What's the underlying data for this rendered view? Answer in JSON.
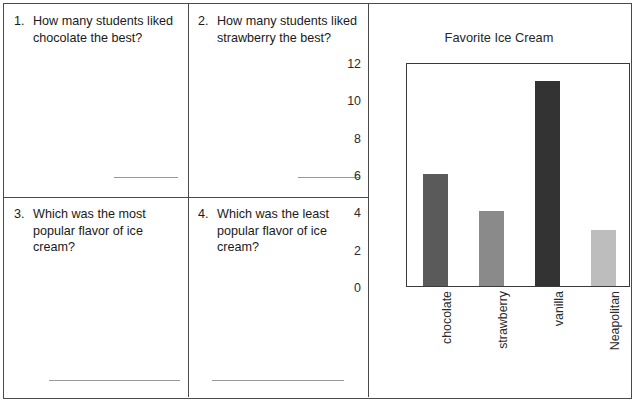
{
  "worksheet": {
    "questions": [
      {
        "number": "1.",
        "text": "How many students liked chocolate the best?"
      },
      {
        "number": "2.",
        "text": "How many students liked strawberry the best?"
      },
      {
        "number": "3.",
        "text": "Which was the most popular flavor of ice cream?"
      },
      {
        "number": "4.",
        "text": "Which was the least popular flavor of ice cream?"
      }
    ],
    "answer_values": [
      "",
      "",
      "",
      ""
    ]
  },
  "chart_data": {
    "type": "bar",
    "title": "Favorite Ice Cream",
    "xlabel": "",
    "ylabel": "",
    "categories": [
      "chocolate",
      "strawberry",
      "vanilla",
      "Neapolitan"
    ],
    "values": [
      6,
      4,
      11,
      3
    ],
    "ylim": [
      0,
      12
    ],
    "yticks": [
      0,
      2,
      4,
      6,
      8,
      10,
      12
    ],
    "grid": false,
    "legend": false,
    "bar_colors": [
      "#5a5a5a",
      "#8a8a8a",
      "#333333",
      "#bdbdbd"
    ],
    "xtick_rotation": 90
  }
}
